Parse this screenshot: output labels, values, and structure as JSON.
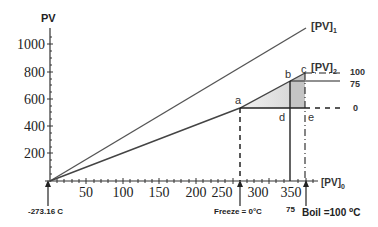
{
  "diagram": {
    "y_axis_label": "PV",
    "x_axis_label": "[PV]",
    "x_axis_label_sub": "0",
    "y_ticks": [
      "1000",
      "800",
      "600",
      "400",
      "200"
    ],
    "x_ticks": [
      "50",
      "100",
      "150",
      "200",
      "250",
      "300",
      "350"
    ],
    "line1_label": "[PV]",
    "line1_label_sub": "1",
    "line2_label": "[PV]",
    "line2_label_sub": "2",
    "points": {
      "a": "a",
      "b": "b",
      "c": "c",
      "d": "d",
      "e": "e"
    },
    "right_scale": [
      "100",
      "75",
      "0"
    ],
    "origin_annotation": "-273.16 C",
    "freeze_annotation": "Freeze = 0°C",
    "boil_annotation": "Boil =100 ⁰C",
    "mid_annotation": "75",
    "colors": {
      "axis": "#333333",
      "line": "#555555",
      "shade_light": "#e4e4e4",
      "shade_dark": "#c4c4c4"
    }
  }
}
